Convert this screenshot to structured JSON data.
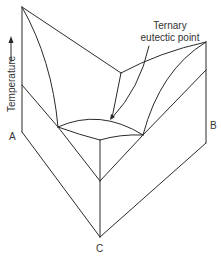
{
  "diagram": {
    "axis_label": "Temperature",
    "axis_arrow": "→",
    "vertices": {
      "a": "A",
      "b": "B",
      "c": "C"
    },
    "callout": {
      "line1": "Ternary",
      "line2": "eutectic point"
    }
  }
}
